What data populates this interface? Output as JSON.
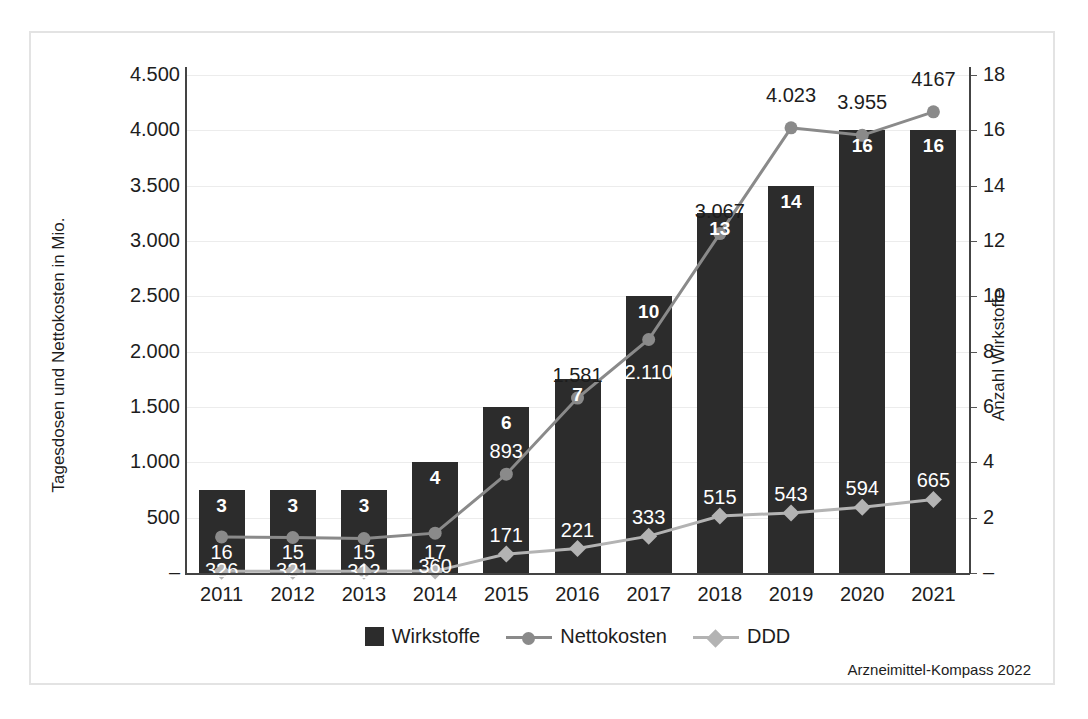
{
  "chart_data": {
    "type": "bar",
    "title": "",
    "xlabel": "",
    "ylabel": "Tagesdosen und Nettokosten in Mio.",
    "ylabel_secondary": "Anzahl Wirkstoffe",
    "categories": [
      "2011",
      "2012",
      "2013",
      "2014",
      "2015",
      "2016",
      "2017",
      "2018",
      "2019",
      "2020",
      "2021"
    ],
    "ylim": [
      0,
      4500
    ],
    "ylim_secondary": [
      0,
      18
    ],
    "ytick_labels": [
      "4.500",
      "4.000",
      "3.500",
      "3.000",
      "2.500",
      "2.000",
      "1.500",
      "1.000",
      "500",
      "–"
    ],
    "ytick_values": [
      4500,
      4000,
      3500,
      3000,
      2500,
      2000,
      1500,
      1000,
      500,
      0
    ],
    "ytick_labels_secondary": [
      "18",
      "16",
      "14",
      "12",
      "10",
      "8",
      "6",
      "4",
      "2",
      "–"
    ],
    "ytick_values_secondary": [
      18,
      16,
      14,
      12,
      10,
      8,
      6,
      4,
      2,
      0
    ],
    "grid": true,
    "legend_position": "bottom",
    "series": [
      {
        "name": "Wirkstoffe",
        "type": "bar",
        "axis": "secondary",
        "color": "#2c2c2c",
        "values": [
          3,
          3,
          3,
          4,
          6,
          7,
          10,
          13,
          14,
          16,
          16
        ],
        "labels": [
          "3",
          "3",
          "3",
          "4",
          "6",
          "7",
          "10",
          "13",
          "14",
          "16",
          "16"
        ]
      },
      {
        "name": "Nettokosten",
        "type": "line",
        "axis": "primary",
        "color": "#8a8a8a",
        "marker": "circle",
        "values": [
          326,
          321,
          312,
          360,
          893,
          1581,
          2110,
          3067,
          4023,
          3955,
          4167
        ],
        "labels": [
          "326",
          "321",
          "312",
          "360",
          "893",
          "1.581",
          "2.110",
          "3.067",
          "4.023",
          "3.955",
          "4167"
        ]
      },
      {
        "name": "DDD",
        "type": "line",
        "axis": "primary",
        "color": "#b3b3b3",
        "marker": "diamond",
        "values": [
          16,
          15,
          15,
          17,
          171,
          221,
          333,
          515,
          543,
          594,
          665
        ],
        "labels": [
          "16",
          "15",
          "15",
          "17",
          "171",
          "221",
          "333",
          "515",
          "543",
          "594",
          "665"
        ]
      }
    ]
  },
  "legend": {
    "items": [
      {
        "label": "Wirkstoffe",
        "marker": "square",
        "color": "#2c2c2c"
      },
      {
        "label": "Nettokosten",
        "marker": "circle",
        "color": "#8a8a8a"
      },
      {
        "label": "DDD",
        "marker": "diamond",
        "color": "#b3b3b3"
      }
    ]
  },
  "source": "Arzneimittel-Kompass 2022"
}
